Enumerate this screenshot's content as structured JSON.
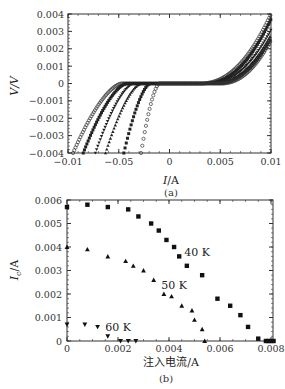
{
  "chart_data": [
    {
      "panel": "(a)",
      "type": "scatter",
      "title": "",
      "xlabel": "I/A",
      "ylabel": "V/V",
      "xlim": [
        -0.01,
        0.01
      ],
      "ylim": [
        -0.004,
        0.004
      ],
      "xticks": [
        -0.01,
        -0.005,
        0,
        0.005,
        0.01
      ],
      "xtick_labels": [
        "-0.01",
        "-0.05",
        "0",
        "0.005",
        "0.01"
      ],
      "yticks": [
        0.004,
        0.003,
        0.002,
        0.001,
        0,
        -0.001,
        -0.002,
        -0.003,
        -0.004
      ],
      "ytick_labels": [
        "0.004",
        "0.003",
        "0.002",
        "0.001",
        "0",
        "−0.001",
        "−0.002",
        "−0.003",
        "−0.004"
      ],
      "grid": false,
      "legend": null,
      "series": [
        {
          "name": "curve-1",
          "marker": "open-circle",
          "critical_current": 0.0047,
          "x_at_vmin": -0.0095,
          "v_at_xmax": 0.004,
          "x_at_vmax": 0.0093
        },
        {
          "name": "curve-2",
          "marker": "filled-square",
          "critical_current": 0.0042,
          "x_at_vmin": -0.0085,
          "v_at_xmax": 0.0037
        },
        {
          "name": "curve-3",
          "marker": "down-triangle",
          "critical_current": 0.0035,
          "x_at_vmin": -0.0073,
          "v_at_xmax": 0.0031
        },
        {
          "name": "curve-4",
          "marker": "up-triangle",
          "critical_current": 0.0028,
          "x_at_vmin": -0.0063,
          "v_at_xmax": 0.0028
        },
        {
          "name": "curve-5",
          "marker": "filled-square",
          "critical_current": 0.0019,
          "x_at_vmin": -0.0045,
          "v_at_xmax": 0.0026
        },
        {
          "name": "curve-6",
          "marker": "open-circle",
          "critical_current": 0.001,
          "x_at_vmin": -0.0028,
          "v_at_xmax": 0.0025
        }
      ]
    },
    {
      "panel": "(b)",
      "type": "scatter",
      "title": "",
      "xlabel": "注入电流/A",
      "ylabel": "I_c/A",
      "ylabel_main": "I",
      "ylabel_sub": "c",
      "ylabel_unit": "/A",
      "xlim": [
        0,
        0.0082
      ],
      "ylim": [
        0,
        0.006
      ],
      "xticks": [
        0,
        0.002,
        0.004,
        0.006,
        0.008
      ],
      "xtick_labels": [
        "0",
        "0.002",
        "0.004",
        "0.006",
        "0.008"
      ],
      "yticks": [
        0,
        0.001,
        0.002,
        0.003,
        0.004,
        0.005,
        0.006
      ],
      "ytick_labels": [
        "0",
        "0.001",
        "0.002",
        "0.003",
        "0.004",
        "0.005",
        "0.006"
      ],
      "grid": false,
      "series": [
        {
          "name": "40 K",
          "marker": "square",
          "x": [
            0.0,
            0.0008,
            0.0016,
            0.0024,
            0.0028,
            0.0033,
            0.0036,
            0.0039,
            0.0042,
            0.0044,
            0.0047,
            0.0053,
            0.0059,
            0.0064,
            0.0068,
            0.0071,
            0.0075,
            0.0078,
            0.0079,
            0.008,
            0.0081
          ],
          "y": [
            0.0057,
            0.0058,
            0.0057,
            0.0056,
            0.0053,
            0.005,
            0.0047,
            0.0043,
            0.004,
            0.0036,
            0.0032,
            0.0028,
            0.0018,
            0.0015,
            0.0011,
            0.0006,
            0.0001,
            0.0,
            0.0,
            0.0,
            0.0
          ]
        },
        {
          "name": "50 K",
          "marker": "triangle-up",
          "x": [
            0.0,
            0.0008,
            0.0016,
            0.0023,
            0.0026,
            0.003,
            0.0034,
            0.0038,
            0.0041,
            0.0045,
            0.0049,
            0.005,
            0.0053,
            0.0054
          ],
          "y": [
            0.004,
            0.0039,
            0.0036,
            0.0034,
            0.0032,
            0.003,
            0.0026,
            0.002,
            0.0019,
            0.0015,
            0.0013,
            0.0009,
            0.0005,
            0.0
          ]
        },
        {
          "name": "60 K",
          "marker": "triangle-down",
          "x": [
            0.0,
            0.0007,
            0.0012,
            0.0016,
            0.0021,
            0.0024,
            0.0027
          ],
          "y": [
            0.0007,
            0.0007,
            0.0006,
            0.0002,
            0.0,
            0.0,
            0.0
          ]
        }
      ],
      "annotations": [
        {
          "text": "40 K",
          "x": 0.0046,
          "y": 0.0038
        },
        {
          "text": "50 K",
          "x": 0.0037,
          "y": 0.0024
        },
        {
          "text": "60 K",
          "x": 0.0015,
          "y": 0.0006
        }
      ]
    }
  ],
  "captions": {
    "a": "(a)",
    "b": "(b)"
  }
}
